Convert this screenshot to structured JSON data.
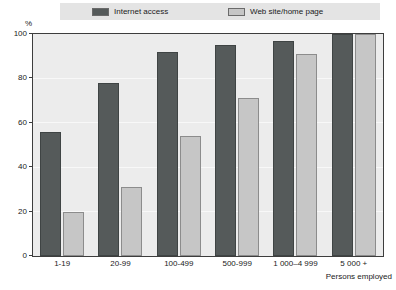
{
  "chart_data": {
    "type": "bar",
    "title": "",
    "subtitle": "",
    "xlabel": "Persons employed",
    "ylabel": "%",
    "ylim": [
      0,
      100
    ],
    "yticks": [
      100,
      80,
      60,
      40,
      20,
      0
    ],
    "grid": true,
    "legend_position": "top",
    "categories": [
      "1-19",
      "20-99",
      "100-499",
      "500-999",
      "1 000–4 999",
      "5 000 +"
    ],
    "series": [
      {
        "name": "Internet access",
        "color": "#555a5a",
        "values": [
          56,
          78,
          92,
          95,
          97,
          100
        ]
      },
      {
        "name": "Web site/home page",
        "color": "#c6c6c6",
        "values": [
          20,
          31,
          54,
          71,
          91,
          100
        ]
      }
    ]
  },
  "legend": {
    "items": [
      {
        "label": "Internet access",
        "swatch_name": "legend-swatch-internet-access"
      },
      {
        "label": "Web site/home page",
        "swatch_name": "legend-swatch-web-site-home-page"
      }
    ]
  },
  "axes": {
    "y_unit": "%",
    "y_ticks": [
      "100",
      "80",
      "60",
      "40",
      "20",
      "0"
    ],
    "x_title": "Persons employed",
    "x_ticks": [
      "1-19",
      "20-99",
      "100-499",
      "500-999",
      "1 000–4 999",
      "5 000 +"
    ]
  },
  "colors": {
    "series_internet": "#555a5a",
    "series_website": "#c6c6c6",
    "plot_background": "#ececec",
    "legend_background": "#e4e4e4",
    "frame": "#3d3d3d"
  }
}
